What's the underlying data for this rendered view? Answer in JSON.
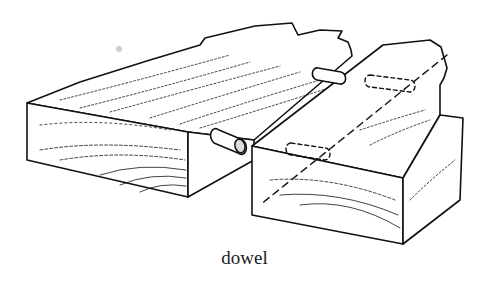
{
  "caption": "dowel",
  "illustration": {
    "subject": "dowel joint between two wooden boards",
    "parts": [
      "left-board",
      "right-board",
      "dowel-pin-front",
      "dowel-pin-back",
      "hidden-dowel-holes",
      "hidden-centerline"
    ]
  },
  "colors": {
    "ink": "#111111",
    "background": "#ffffff"
  }
}
